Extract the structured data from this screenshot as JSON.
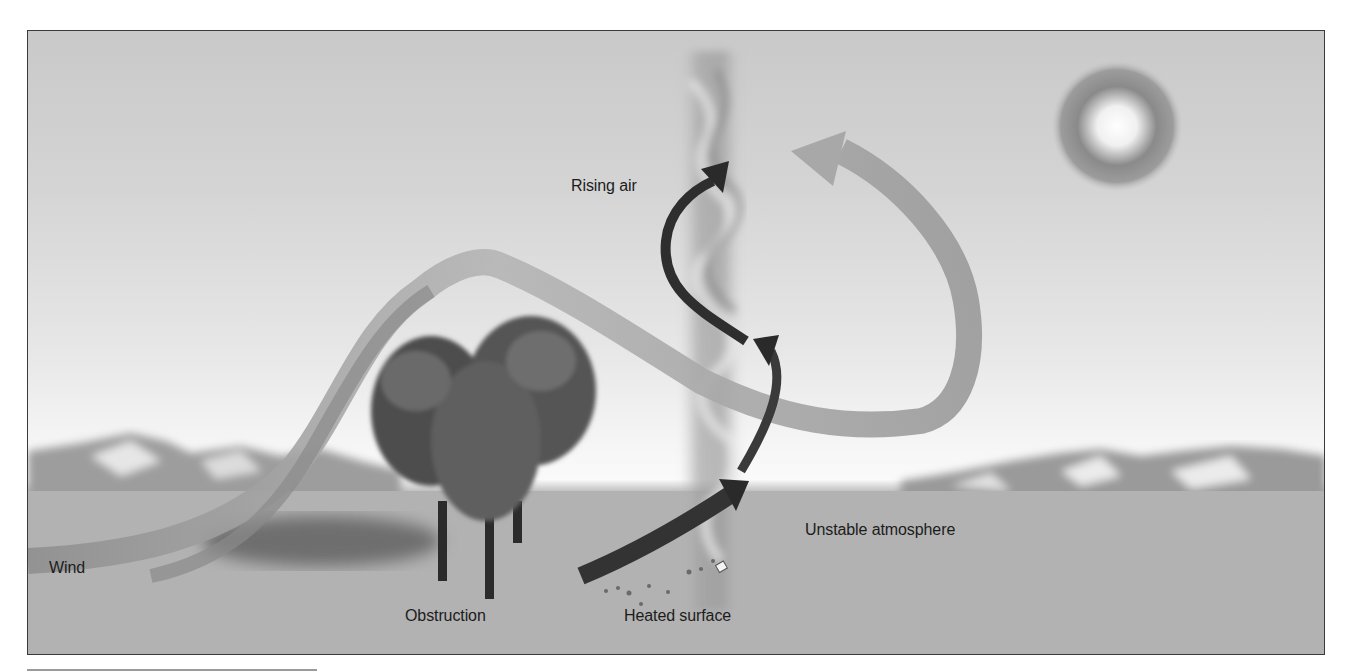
{
  "figure": {
    "labels": {
      "rising_air": "Rising air",
      "wind": "Wind",
      "obstruction": "Obstruction",
      "heated_surface": "Heated surface",
      "unstable_atmosphere": "Unstable atmosphere"
    },
    "colors": {
      "sky_top": "#c9c9c9",
      "sky_horizon": "#fafafa",
      "ground": "#b3b3b3",
      "wind_ribbon": "#a8a8a8",
      "rising_arrow": "#2a2a2a",
      "frame": "#3a3a3a"
    },
    "elements": [
      "sun",
      "dust-devil-column",
      "trees",
      "mountains",
      "wind-ribbon",
      "rising-air-arrows",
      "debris"
    ]
  }
}
